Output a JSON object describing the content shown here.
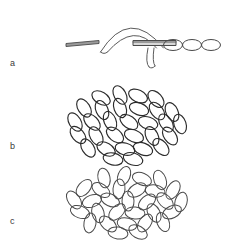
{
  "figure": {
    "width": 232,
    "height": 241,
    "background_color": "#ffffff",
    "stroke_color": "#4a4a4a",
    "dark_stroke_color": "#2b2b2b",
    "label_color": "#3a3a3a",
    "panels": [
      {
        "id": "a",
        "label": "a",
        "label_x": 10,
        "label_y": 59,
        "description": "single elongated particle shown in successive orientations: edge-on flat rod, bent arch, and three face-on ellipses"
      },
      {
        "id": "b",
        "label": "b",
        "label_x": 10,
        "label_y": 142,
        "description": "dense oval cluster of aligned ellipses"
      },
      {
        "id": "c",
        "label": "c",
        "label_x": 10,
        "label_y": 217,
        "description": "cluster of randomly oriented ellipses"
      }
    ]
  },
  "chart_data": {
    "type": "scatter",
    "title": "",
    "xlabel": "",
    "ylabel": "",
    "panel_a": {
      "rod_edge_on": {
        "x1": 66,
        "y1": 45,
        "x2": 99,
        "y2": 42,
        "thickness": 3
      },
      "arch": {
        "start_x": 104,
        "start_y": 52,
        "apex_x": 133,
        "apex_y": 14,
        "end_x": 160,
        "end_y": 48,
        "tube_width": 7
      },
      "cross_rod": {
        "x1": 133,
        "y1": 43,
        "x2": 176,
        "y2": 43,
        "thickness": 5
      },
      "tail": {
        "start_x": 150,
        "start_y": 48,
        "end_x": 152,
        "end_y": 67
      },
      "face_on_ellipses": [
        {
          "cx": 173,
          "cy": 45,
          "rx": 9.5,
          "ry": 5.5,
          "angle": 0
        },
        {
          "cx": 192,
          "cy": 45,
          "rx": 9.5,
          "ry": 5.5,
          "angle": 0
        },
        {
          "cx": 211,
          "cy": 45,
          "rx": 9.5,
          "ry": 5.5,
          "angle": 0
        }
      ]
    },
    "panel_b": {
      "cluster_center_x": 121,
      "cluster_center_y": 124,
      "cluster_rx": 56,
      "cluster_ry": 32,
      "orientation": "aligned",
      "mean_angle_deg": 55,
      "angle_spread_deg": 18,
      "count": 30,
      "ellipses": [
        {
          "cx": 101,
          "cy": 98,
          "rx": 10,
          "ry": 6,
          "angle": 30
        },
        {
          "cx": 120,
          "cy": 95,
          "rx": 10,
          "ry": 6,
          "angle": 62
        },
        {
          "cx": 138,
          "cy": 96,
          "rx": 10,
          "ry": 6,
          "angle": 25
        },
        {
          "cx": 156,
          "cy": 99,
          "rx": 10,
          "ry": 6,
          "angle": 48
        },
        {
          "cx": 84,
          "cy": 108,
          "rx": 10,
          "ry": 6,
          "angle": 58
        },
        {
          "cx": 102,
          "cy": 110,
          "rx": 10,
          "ry": 6,
          "angle": 66
        },
        {
          "cx": 120,
          "cy": 108,
          "rx": 10,
          "ry": 6,
          "angle": 70
        },
        {
          "cx": 139,
          "cy": 109,
          "rx": 10,
          "ry": 6,
          "angle": 20
        },
        {
          "cx": 157,
          "cy": 111,
          "rx": 10,
          "ry": 6,
          "angle": 52
        },
        {
          "cx": 172,
          "cy": 112,
          "rx": 10,
          "ry": 6,
          "angle": 65
        },
        {
          "cx": 75,
          "cy": 122,
          "rx": 10,
          "ry": 6,
          "angle": 60
        },
        {
          "cx": 92,
          "cy": 122,
          "rx": 10,
          "ry": 6,
          "angle": 45
        },
        {
          "cx": 110,
          "cy": 121,
          "rx": 10,
          "ry": 6,
          "angle": 68
        },
        {
          "cx": 129,
          "cy": 122,
          "rx": 10,
          "ry": 6,
          "angle": 35
        },
        {
          "cx": 148,
          "cy": 123,
          "rx": 10,
          "ry": 6,
          "angle": 18
        },
        {
          "cx": 166,
          "cy": 123,
          "rx": 10,
          "ry": 6,
          "angle": 57
        },
        {
          "cx": 180,
          "cy": 124,
          "rx": 10,
          "ry": 6,
          "angle": 72
        },
        {
          "cx": 78,
          "cy": 135,
          "rx": 10,
          "ry": 6,
          "angle": 50
        },
        {
          "cx": 96,
          "cy": 136,
          "rx": 10,
          "ry": 6,
          "angle": 62
        },
        {
          "cx": 115,
          "cy": 135,
          "rx": 10,
          "ry": 6,
          "angle": 40
        },
        {
          "cx": 134,
          "cy": 136,
          "rx": 10,
          "ry": 6,
          "angle": 22
        },
        {
          "cx": 152,
          "cy": 136,
          "rx": 10,
          "ry": 6,
          "angle": 64
        },
        {
          "cx": 170,
          "cy": 136,
          "rx": 10,
          "ry": 6,
          "angle": 55
        },
        {
          "cx": 88,
          "cy": 148,
          "rx": 10,
          "ry": 6,
          "angle": 58
        },
        {
          "cx": 106,
          "cy": 149,
          "rx": 10,
          "ry": 6,
          "angle": 30
        },
        {
          "cx": 125,
          "cy": 149,
          "rx": 10,
          "ry": 6,
          "angle": 15
        },
        {
          "cx": 143,
          "cy": 149,
          "rx": 10,
          "ry": 6,
          "angle": 20
        },
        {
          "cx": 161,
          "cy": 147,
          "rx": 10,
          "ry": 6,
          "angle": 48
        },
        {
          "cx": 113,
          "cy": 159,
          "rx": 10,
          "ry": 6,
          "angle": 12
        },
        {
          "cx": 133,
          "cy": 159,
          "rx": 10,
          "ry": 6,
          "angle": 18
        }
      ]
    },
    "panel_c": {
      "cluster_center_x": 121,
      "cluster_center_y": 203,
      "cluster_rx": 56,
      "cluster_ry": 30,
      "orientation": "random",
      "mean_angle_deg": 0,
      "angle_spread_deg": 180,
      "count": 30,
      "ellipses": [
        {
          "cx": 104,
          "cy": 178,
          "rx": 10,
          "ry": 6,
          "angle": 78
        },
        {
          "cx": 124,
          "cy": 176,
          "rx": 10,
          "ry": 6,
          "angle": 112
        },
        {
          "cx": 142,
          "cy": 179,
          "rx": 10,
          "ry": 6,
          "angle": 22
        },
        {
          "cx": 160,
          "cy": 180,
          "rx": 10,
          "ry": 6,
          "angle": 70
        },
        {
          "cx": 84,
          "cy": 188,
          "rx": 10,
          "ry": 6,
          "angle": 130
        },
        {
          "cx": 101,
          "cy": 190,
          "rx": 10,
          "ry": 6,
          "angle": 35
        },
        {
          "cx": 119,
          "cy": 189,
          "rx": 10,
          "ry": 6,
          "angle": 95
        },
        {
          "cx": 137,
          "cy": 190,
          "rx": 10,
          "ry": 6,
          "angle": 150
        },
        {
          "cx": 155,
          "cy": 191,
          "rx": 10,
          "ry": 6,
          "angle": 10
        },
        {
          "cx": 173,
          "cy": 190,
          "rx": 10,
          "ry": 6,
          "angle": 120
        },
        {
          "cx": 74,
          "cy": 200,
          "rx": 10,
          "ry": 6,
          "angle": 55
        },
        {
          "cx": 92,
          "cy": 201,
          "rx": 10,
          "ry": 6,
          "angle": 160
        },
        {
          "cx": 110,
          "cy": 200,
          "rx": 10,
          "ry": 6,
          "angle": 25
        },
        {
          "cx": 128,
          "cy": 201,
          "rx": 10,
          "ry": 6,
          "angle": 88
        },
        {
          "cx": 147,
          "cy": 202,
          "rx": 10,
          "ry": 6,
          "angle": 140
        },
        {
          "cx": 165,
          "cy": 201,
          "rx": 10,
          "ry": 6,
          "angle": 45
        },
        {
          "cx": 181,
          "cy": 202,
          "rx": 10,
          "ry": 6,
          "angle": 105
        },
        {
          "cx": 80,
          "cy": 212,
          "rx": 10,
          "ry": 6,
          "angle": 20
        },
        {
          "cx": 98,
          "cy": 213,
          "rx": 10,
          "ry": 6,
          "angle": 75
        },
        {
          "cx": 117,
          "cy": 212,
          "rx": 10,
          "ry": 6,
          "angle": 135
        },
        {
          "cx": 135,
          "cy": 213,
          "rx": 10,
          "ry": 6,
          "angle": 5
        },
        {
          "cx": 154,
          "cy": 213,
          "rx": 10,
          "ry": 6,
          "angle": 62
        },
        {
          "cx": 172,
          "cy": 212,
          "rx": 10,
          "ry": 6,
          "angle": 155
        },
        {
          "cx": 90,
          "cy": 223,
          "rx": 10,
          "ry": 6,
          "angle": 100
        },
        {
          "cx": 108,
          "cy": 224,
          "rx": 10,
          "ry": 6,
          "angle": 40
        },
        {
          "cx": 127,
          "cy": 224,
          "rx": 10,
          "ry": 6,
          "angle": 15
        },
        {
          "cx": 145,
          "cy": 223,
          "rx": 10,
          "ry": 6,
          "angle": 125
        },
        {
          "cx": 163,
          "cy": 222,
          "rx": 10,
          "ry": 6,
          "angle": 68
        },
        {
          "cx": 118,
          "cy": 233,
          "rx": 10,
          "ry": 6,
          "angle": 8
        },
        {
          "cx": 138,
          "cy": 232,
          "rx": 10,
          "ry": 6,
          "angle": 30
        }
      ]
    }
  }
}
